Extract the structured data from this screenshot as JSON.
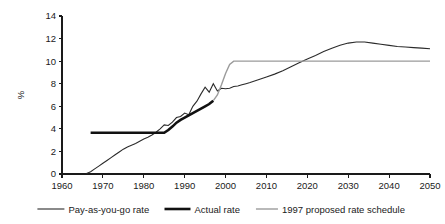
{
  "chart_data": {
    "type": "line",
    "title": "",
    "subtitle": "",
    "xlabel": "",
    "ylabel": "%",
    "xlim": [
      1960,
      2050
    ],
    "ylim": [
      0,
      14
    ],
    "ytick_labels": [
      "0",
      "2",
      "4",
      "6",
      "8",
      "10",
      "12",
      "14"
    ],
    "ytick_values": [
      0,
      2,
      4,
      6,
      8,
      10,
      12,
      14
    ],
    "xtick_labels": [
      "1960",
      "1970",
      "1980",
      "1990",
      "2000",
      "2010",
      "2020",
      "2030",
      "2040",
      "2050"
    ],
    "xtick_values": [
      1960,
      1970,
      1980,
      1990,
      2000,
      2010,
      2020,
      2030,
      2040,
      2050
    ],
    "grid": false,
    "legend_position": "bottom",
    "series": [
      {
        "name": "Pay-as-you-go rate",
        "color": "#2b2b2b",
        "width": 1.1,
        "x": [
          1966,
          1967,
          1968,
          1969,
          1970,
          1971,
          1972,
          1973,
          1974,
          1975,
          1976,
          1977,
          1978,
          1979,
          1980,
          1981,
          1982,
          1983,
          1984,
          1985,
          1986,
          1987,
          1988,
          1989,
          1990,
          1991,
          1992,
          1993,
          1994,
          1995,
          1996,
          1997,
          1998,
          1999,
          2000,
          2001,
          2002,
          2003,
          2004,
          2005,
          2006,
          2008,
          2010,
          2012,
          2014,
          2016,
          2018,
          2020,
          2022,
          2024,
          2026,
          2028,
          2030,
          2032,
          2034,
          2036,
          2038,
          2040,
          2042,
          2044,
          2046,
          2048,
          2050
        ],
        "y": [
          0.05,
          0.2,
          0.45,
          0.7,
          0.95,
          1.2,
          1.45,
          1.7,
          1.95,
          2.2,
          2.4,
          2.55,
          2.7,
          2.9,
          3.1,
          3.25,
          3.45,
          3.7,
          4.0,
          4.35,
          4.3,
          4.6,
          5.0,
          5.1,
          5.4,
          5.25,
          6.0,
          6.45,
          7.1,
          7.7,
          7.25,
          8.0,
          7.35,
          7.6,
          7.55,
          7.6,
          7.75,
          7.8,
          7.9,
          8.0,
          8.1,
          8.35,
          8.6,
          8.85,
          9.15,
          9.5,
          9.85,
          10.2,
          10.5,
          10.85,
          11.15,
          11.4,
          11.6,
          11.7,
          11.7,
          11.6,
          11.5,
          11.4,
          11.3,
          11.25,
          11.2,
          11.15,
          11.1
        ]
      },
      {
        "name": "Actual rate",
        "color": "#111111",
        "width": 2.6,
        "x": [
          1967,
          1985,
          1986,
          1987,
          1988,
          1989,
          1990,
          1991,
          1992,
          1993,
          1994,
          1995,
          1996,
          1997
        ],
        "y": [
          3.65,
          3.65,
          3.9,
          4.2,
          4.55,
          4.8,
          5.0,
          5.2,
          5.4,
          5.6,
          5.8,
          6.0,
          6.2,
          6.5
        ]
      },
      {
        "name": "1997 proposed rate schedule",
        "color": "#9b9b9b",
        "width": 1.4,
        "x": [
          1997,
          1998,
          1999,
          2000,
          2001,
          2002,
          2050
        ],
        "y": [
          6.5,
          7.0,
          7.9,
          8.9,
          9.7,
          10.0,
          10.0
        ]
      }
    ],
    "annotations": []
  },
  "legend": {
    "items": [
      {
        "label": "Pay-as-you-go rate",
        "color": "#2b2b2b",
        "width": 1.1
      },
      {
        "label": "Actual rate",
        "color": "#111111",
        "width": 2.6
      },
      {
        "label": "1997 proposed rate schedule",
        "color": "#9b9b9b",
        "width": 1.4
      }
    ]
  }
}
